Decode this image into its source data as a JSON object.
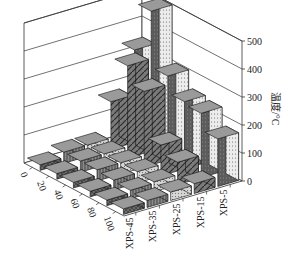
{
  "chart_data": {
    "type": "bar3d",
    "title": "",
    "zlabel": "温度/°C",
    "zlim": [
      0,
      500
    ],
    "z_ticks": [
      0,
      100,
      200,
      300,
      400,
      500
    ],
    "row_axis_ticks": [
      "0",
      "20",
      "40",
      "60",
      "80",
      "100"
    ],
    "col_axis_ticks": [
      "XPS-45",
      "XPS-35",
      "XPS-25",
      "XPS-15",
      "XPS-5"
    ],
    "grid": true,
    "series": [
      {
        "name": "XPS-45",
        "pattern": "crosshatch",
        "values": [
          20,
          20,
          20,
          20,
          20,
          20
        ]
      },
      {
        "name": "XPS-35",
        "pattern": "vertical-stripes",
        "values": [
          40,
          40,
          40,
          35,
          30,
          25
        ]
      },
      {
        "name": "XPS-25",
        "pattern": "dots",
        "values": [
          40,
          40,
          40,
          40,
          35,
          30
        ]
      },
      {
        "name": "XPS-15",
        "pattern": "diagonal",
        "values": [
          170,
          330,
          270,
          110,
          80,
          35
        ]
      },
      {
        "name": "XPS-5",
        "pattern": "light-dots",
        "values": [
          330,
          500,
          300,
          240,
          230,
          170
        ]
      }
    ]
  }
}
